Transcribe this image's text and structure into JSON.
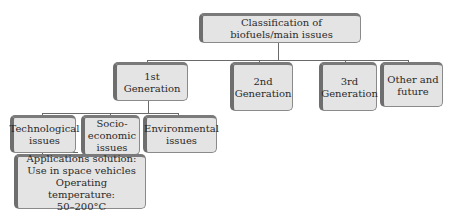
{
  "diagram": {
    "root": {
      "label": "Classification of biofuels/main issues"
    },
    "generations": [
      {
        "line1": "1st",
        "line2": "Generation"
      },
      {
        "line1": "2nd",
        "line2": "Generation"
      },
      {
        "line1": "3rd",
        "line2": "Generation"
      },
      {
        "line1": "Other and",
        "line2": "future"
      }
    ],
    "first_generation_issues": [
      {
        "line1": "Technological",
        "line2": "issues"
      },
      {
        "line1": "Socio-",
        "line2": "economic",
        "line3": "issues"
      },
      {
        "line1": "Environmental",
        "line2": "issues"
      }
    ],
    "technological_detail": {
      "line1": "Applications solution:",
      "line2": "Use in space vehicles",
      "line3": "Operating temperature:",
      "line4": "50–200°C"
    }
  }
}
